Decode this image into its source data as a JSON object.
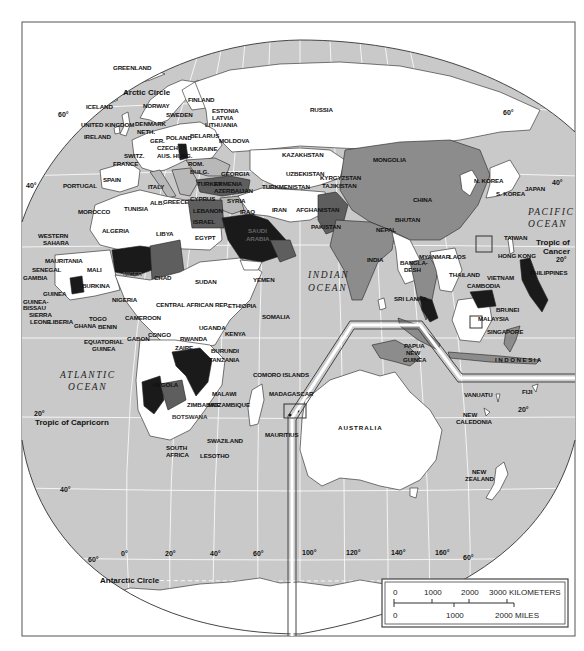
{
  "map": {
    "projection": "Eastern Hemisphere",
    "oceans": [
      {
        "id": "atlantic",
        "line1": "ATLANTIC",
        "line2": "OCEAN"
      },
      {
        "id": "indian",
        "line1": "INDIAN",
        "line2": "OCEAN"
      },
      {
        "id": "pacific",
        "line1": "PACIFIC",
        "line2": "OCEAN"
      }
    ],
    "circles": {
      "arctic": "Arctic Circle",
      "antarctic": "Antarctic Circle",
      "cancer_line1": "Tropic of",
      "cancer_line2": "Cancer",
      "capricorn": "Tropic of Capricorn"
    },
    "latitude_labels": {
      "n60_left": "60°",
      "n60_right": "60°",
      "n40_left": "40°",
      "n40_right": "40°",
      "n20_right": "20°",
      "s20_left": "20°",
      "s20_right": "20°",
      "s40_left": "40°",
      "s60_left": "60°",
      "s60_right": "60°"
    },
    "longitude_labels": [
      "0°",
      "20°",
      "40°",
      "60°",
      "100°",
      "120°",
      "140°",
      "160°"
    ],
    "countries": {
      "greenland": "GREENLAND",
      "iceland": "ICELAND",
      "norway": "NORWAY",
      "sweden": "SWEDEN",
      "finland": "FINLAND",
      "estonia": "ESTONIA",
      "latvia": "LATVIA",
      "lithuania": "LITHUANIA",
      "uk": "UNITED KINGDOM",
      "ireland": "IRELAND",
      "denmark": "DENMARK",
      "neth": "NETH.",
      "belarus": "BELARUS",
      "poland": "POLAND",
      "ger": "GER.",
      "czech": "CZECH",
      "ukraine": "UKRAINE",
      "moldova": "MOLDOVA",
      "switz": "SWITZ.",
      "aus_hung": "AUS. HUNG.",
      "france": "FRANCE",
      "slovenia": "SLOVENIA",
      "rom": "ROM.",
      "bulg": "BULG.",
      "portugal": "PORTUGAL",
      "spain": "SPAIN",
      "italy": "ITALY",
      "alb": "ALB.",
      "greece": "GREECE",
      "turkey": "TURKEY",
      "georgia": "GEORGIA",
      "armenia": "ARMENIA",
      "azerbaijan": "AZERBAIJAN",
      "cyprus": "CYPRUS",
      "syria": "SYRIA",
      "lebanon": "LEBANON",
      "israel": "ISRAEL",
      "iraq": "IRAQ",
      "iran": "IRAN",
      "russia": "RUSSIA",
      "kazakhstan": "KAZAKHSTAN",
      "uzbekistan": "UZBEKISTAN",
      "kyrgyzstan": "KYRGYZSTAN",
      "turkmenistan": "TURKMENISTAN",
      "tajikistan": "TAJIKISTAN",
      "afghanistan": "AFGHANISTAN",
      "pakistan": "PAKISTAN",
      "mongolia": "MONGOLIA",
      "china": "CHINA",
      "n_korea": "N. KOREA",
      "s_korea": "S. KOREA",
      "japan": "JAPAN",
      "nepal": "NEPAL",
      "bhutan": "BHUTAN",
      "india": "INDIA",
      "bangladesh_1": "BANGLA-",
      "bangladesh_2": "DESH",
      "sri_lanka": "SRI LANKA",
      "myanmar": "MYANMAR",
      "laos": "LAOS",
      "thailand": "THAILAND",
      "vietnam": "VIETNAM",
      "cambodia": "CAMBODIA",
      "taiwan": "TAIWAN",
      "hong_kong": "HONG KONG",
      "philippines": "PHILIPPINES",
      "brunei": "BRUNEI",
      "malaysia": "MALAYSIA",
      "singapore": "SINGAPORE",
      "indonesia": "I N D O N E S I A",
      "png_1": "PAPUA",
      "png_2": "NEW",
      "png_3": "GUINEA",
      "australia": "AUSTRALIA",
      "vanuatu": "VANUATU",
      "fiji": "FIJI",
      "new_caledonia_1": "NEW",
      "new_caledonia_2": "CALEDONIA",
      "new_zealand_1": "NEW",
      "new_zealand_2": "ZEALAND",
      "morocco": "MOROCCO",
      "tunisia": "TUNISIA",
      "algeria": "ALGERIA",
      "libya": "LIBYA",
      "egypt": "EGYPT",
      "western_sahara_1": "WESTERN",
      "western_sahara_2": "SAHARA",
      "mauritania": "MAURITANIA",
      "mali": "MALI",
      "niger": "NIGER",
      "chad": "CHAD",
      "sudan": "SUDAN",
      "senegal": "SENEGAL",
      "gambia": "GAMBIA",
      "guinea": "GUINEA",
      "guinea_bissau_1": "GUINEA-",
      "guinea_bissau_2": "BISSAU",
      "sierra_leone_1": "SIERRA",
      "sierra_leone_2": "LEONE",
      "liberia": "LIBERIA",
      "burkina": "BURKINA",
      "ghana": "GHANA",
      "togo": "TOGO",
      "benin": "BENIN",
      "nigeria": "NIGERIA",
      "cameroon": "CAMEROON",
      "car": "CENTRAL AFRICAN REP.",
      "eq_guinea_1": "EQUATORIAL",
      "eq_guinea_2": "GUINEA",
      "gabon": "GABON",
      "congo": "CONGO",
      "zaire": "ZAIRE",
      "ethiopia": "ETHIOPIA",
      "somalia": "SOMALIA",
      "uganda": "UGANDA",
      "kenya": "KENYA",
      "rwanda": "RWANDA",
      "burundi": "BURUNDI",
      "tanzania": "TANZANIA",
      "yemen": "YEMEN",
      "saudi_arabia_1": "SAUDI",
      "saudi_arabia_2": "ARABIA",
      "angola": "ANGOLA",
      "zimbabwe": "ZIMBABWE",
      "mozambique": "MOZAMBIQUE",
      "malawi": "MALAWI",
      "botswana": "BOTSWANA",
      "swaziland": "SWAZILAND",
      "lesotho": "LESOTHO",
      "south_africa_1": "SOUTH",
      "south_africa_2": "AFRICA",
      "madagascar": "MADAGASCAR",
      "comoro": "COMORO ISLANDS",
      "mauritius": "MAURITIUS"
    }
  },
  "scale_bar": {
    "km_ticks": [
      "0",
      "1000",
      "2000",
      "3000 KILOMETERS"
    ],
    "mile_ticks": [
      "0",
      "1000",
      "2000 MILES"
    ]
  }
}
